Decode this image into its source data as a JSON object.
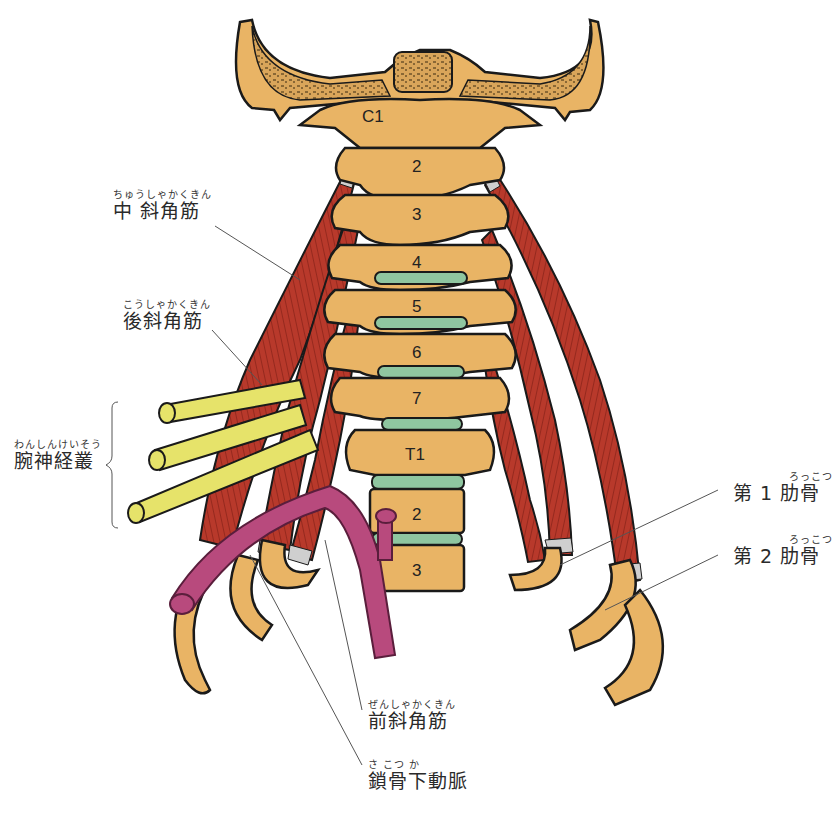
{
  "figure": {
    "colors": {
      "bone": "#e9b465",
      "bone_dark": "#c98f3e",
      "muscle": "#b8392b",
      "muscle_dark": "#7d1e15",
      "tendon": "#cfcfcf",
      "disc": "#8fc6a0",
      "nerve": "#e6e36a",
      "artery": "#b84a7d",
      "outline": "#1a1a1a",
      "leader": "#555555"
    }
  },
  "vertebrae": [
    {
      "id": "C1",
      "label": "C1"
    },
    {
      "id": "C2",
      "label": "2"
    },
    {
      "id": "C3",
      "label": "3"
    },
    {
      "id": "C4",
      "label": "4"
    },
    {
      "id": "C5",
      "label": "5"
    },
    {
      "id": "C6",
      "label": "6"
    },
    {
      "id": "C7",
      "label": "7"
    },
    {
      "id": "T1",
      "label": "T1"
    },
    {
      "id": "T2",
      "label": "2"
    },
    {
      "id": "T3",
      "label": "3"
    }
  ],
  "labels": {
    "middle_scalene": {
      "ruby": "ちゅうしゃかくきん",
      "text": "中 斜角筋"
    },
    "posterior_scalene": {
      "ruby": "こうしゃかくきん",
      "text": "後斜角筋"
    },
    "brachial_plexus": {
      "ruby": "わんしんけいそう",
      "text": "腕神経叢"
    },
    "first_rib": {
      "ruby": "ろっこつ",
      "text": "第 1 肋骨"
    },
    "second_rib": {
      "ruby": "ろっこつ",
      "text": "第 2 肋骨"
    },
    "anterior_scalene": {
      "ruby": "ぜんしゃかくきん",
      "text": "前斜角筋"
    },
    "subclavian_artery": {
      "ruby": "さ こつ か",
      "text": "鎖骨下動脈"
    }
  }
}
